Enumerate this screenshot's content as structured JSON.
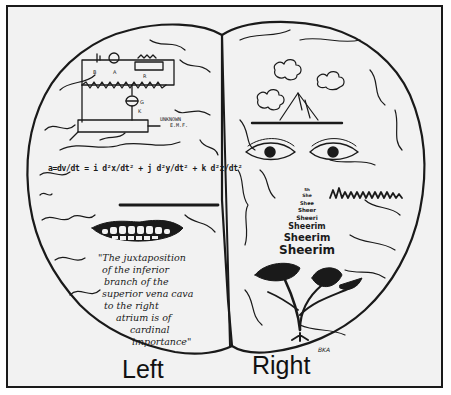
{
  "figure": {
    "type": "hand-drawn illustration",
    "colors": {
      "ink": "#1a1a1a",
      "paper": "#f2f2f2",
      "frame": "#1a1a1a"
    }
  },
  "left_hemisphere": {
    "label": "Left",
    "circuit": {
      "labels": [
        "B",
        "A",
        "R",
        "G",
        "K"
      ],
      "annotation_line1": "UNKNOWN",
      "annotation_line2": "E.M.F."
    },
    "equation": "a = dv/dt = L d²x/dt² + j d²y/dt² + k d²z/dt²",
    "equation_display": "a=dv/dt = i d²x/dt² + j d²y/dt² + k d²z/dt²",
    "straight_line": "straight-line",
    "mouth": "smiling-mouth-with-teeth",
    "quote_lines": [
      "\"The juxtaposition",
      "of the inferior",
      "branch of the",
      "superior vena cava",
      "to the right",
      "atrium is of",
      "cardinal",
      "importance\""
    ]
  },
  "right_hemisphere": {
    "label": "Right",
    "landscape": "clouds-and-mountain",
    "eyes": "pair-of-eyes",
    "squiggle": "wavy-scribble",
    "word_pyramid": [
      "Sh",
      "She",
      "Shee",
      "Sheer",
      "Sheeri",
      "Sheerim",
      "Sheerim",
      "Sheerim"
    ],
    "flower": "flowering-plant",
    "signature": "BKA"
  }
}
